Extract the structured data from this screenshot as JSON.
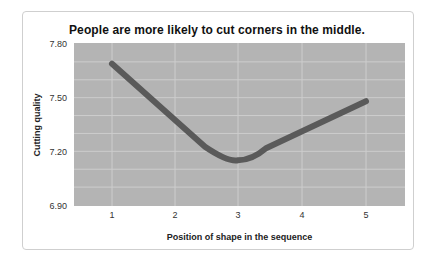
{
  "chart_data": {
    "type": "line",
    "title": "People are more likely to cut corners in the middle.",
    "xlabel": "Position of shape in the sequence",
    "ylabel": "Cutting quality",
    "categories": [
      "1",
      "2",
      "3",
      "4",
      "5"
    ],
    "x": [
      1,
      2,
      3,
      4,
      5
    ],
    "series": [
      {
        "name": "Cutting quality",
        "values": [
          7.69,
          7.41,
          7.15,
          7.31,
          7.48
        ]
      }
    ],
    "ylim": [
      6.9,
      7.8
    ],
    "yticks": [
      "7.80",
      "7.50",
      "7.20",
      "6.90"
    ],
    "grid": true,
    "legend": "none",
    "colors": {
      "plot_bg": "#b4b4b4",
      "grid": "#cdcdcd",
      "line": "#5a5a5a"
    }
  }
}
